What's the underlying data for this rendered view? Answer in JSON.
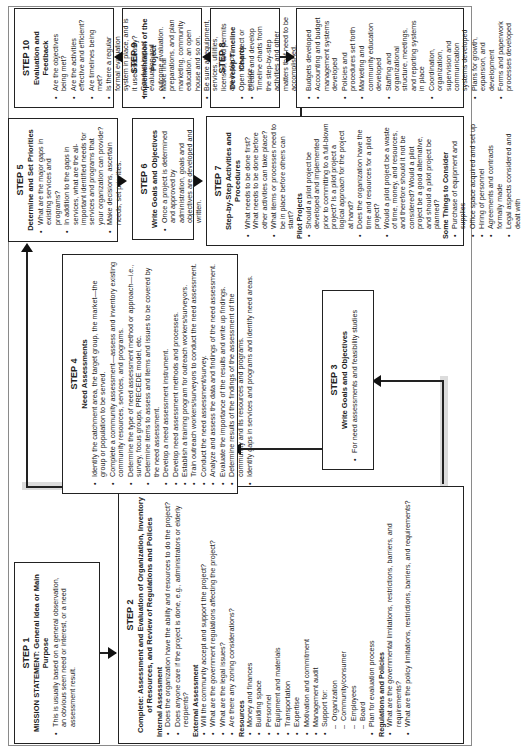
{
  "diagram": {
    "steps": [
      {
        "id": "step1",
        "number": "STEP 1",
        "title": "MISSION STATEMENT:  General Idea or Main Purpose",
        "bullets": [
          "This is usually based on a general observation, an obvious seen need or interest, or a need assessment result."
        ]
      },
      {
        "id": "step2",
        "number": "STEP 2",
        "title": "Complete: Assessment and Evaluation of Organization, Inventory of Resources, and Review of Regulations and Policies",
        "sections": [
          {
            "heading": "Internal Assessment",
            "bullets": [
              "Does the organization have the ability and resources to do the project?",
              "Does anyone care if the project is done, e.g., administrators or elderly recipients?"
            ]
          },
          {
            "heading": "External Assessment",
            "bullets": [
              "Will the community accept and support the project?",
              "What are the government regulations affecting the project?",
              "What are the legal issues?",
              "Are there any zoning considerations?"
            ]
          },
          {
            "heading": "Resources",
            "bullets": [
              "Money and finances",
              "Building space",
              "Personnel",
              "Equipment and materials",
              "Transportation",
              "Expertise",
              "Motivation and commitment",
              "Management audit",
              "Support for:"
            ],
            "sub_bullets": [
              "Organization",
              "Community/consumer",
              "Employees",
              "Board"
            ],
            "after_bullets": [
              "Plan for evaluation process"
            ]
          },
          {
            "heading": "Regulations and Policies",
            "bullets": [
              "What are the governmental limitations, restrictions, barriers, and requirements?",
              "What are the policy limitations, restrictions, barriers, and requirements?"
            ]
          }
        ]
      },
      {
        "id": "step3",
        "number": "STEP 3",
        "title": "Write Goals and Objectives",
        "bullets": [
          "For need assessments and feasibility studies"
        ]
      },
      {
        "id": "step4",
        "number": "STEP 4",
        "title": "Need Assessments",
        "bullets": [
          "Identify the catchment area, the target group, the market—the group or population to be served.",
          "Complete a community assessment—assess and inventory existing community resources, services, and programs.",
          "Determine the type of need assessment method or approach—i.e., survey, focus groups, PRECEDE model, etc.",
          "Determine items to assess and items and issues to be covered by the need assessment.",
          "Develop a need assessment instrument.",
          "Develop need assessment methods and processes.",
          "Establish a training program for outreach workers/surveyors.",
          "Train outreach workers/surveyors to conduct the need assessment.",
          "Conduct the need assessment/survey.",
          "Analyze and assess the data and findings of the need assessment.",
          "Evaluate the importance of the results and write up findings.",
          "Determine results of the findings of the assessment of the community and its resources and programs.",
          "Identify gaps in services and programs and identify need areas."
        ]
      },
      {
        "id": "step5",
        "number": "STEP 5",
        "title": "Determine and Set Priorities",
        "bullets": [
          "What are the major gaps in existing services and programs?",
          "In addition to the gaps in services, what are the all-important identified needs for services and programs that your organization can provide?",
          "Make decisions, ascertain needs, set priorities."
        ]
      },
      {
        "id": "step6",
        "number": "STEP 6",
        "title": "Write Goals and Objectives",
        "bullets": [
          "Once a project is determined and approved by administration, goals and objectives are developed and written."
        ]
      },
      {
        "id": "step7",
        "number": "STEP 7",
        "title": "Step-by-Step Activities and Procedures",
        "bullets": [
          "What needs to be done first? What needs to be done before other activities can take place?",
          "What items or processes need to be in place before others can start?"
        ],
        "sections": [
          {
            "heading": "Pilot Projects",
            "bullets": [
              "Should a pilot project be developed and implemented prior to committing to a full-blown project?  Is a pilot project a logical approach for the project at hand?",
              "Does the organization have the time and resources for a pilot project?",
              "Would a pilot project be a waste of time, money, and resources, and therefore should it not be considered?  Would a pilot project be a good alternative, and should a pilot project be planned?"
            ]
          },
          {
            "heading": "Some Things to Consider",
            "bullets": [
              "Purchase of equipment and supplies",
              "Office space acquired and set up",
              "Hiring of personnel",
              "Agreements and contracts formally made",
              "Legal aspects considered and dealt with"
            ]
          }
        ]
      },
      {
        "id": "step8",
        "number": "STEP 8",
        "title": "Develop Timeline Charts",
        "bullets": [
          "Create and develop Timeline charts from the step-by-step activities and other matters that need to be accomplished."
        ]
      },
      {
        "id": "step8_outcomes",
        "bullets": [
          "Budgets developed",
          "Accounting and budget management systems developed",
          "Policies and procedures set forth",
          "Marketing and community education developed",
          "Staffing and organizational structure, meetings, and reporting systems in place",
          "Coordination, organization, supervision and communication systems developed",
          "Plans for growth, expansion, and development",
          "Forms and paperwork processes developed"
        ]
      },
      {
        "id": "step9",
        "number": "STEP 9",
        "title": "Implementation of the Project",
        "bullets": [
          "Make final preparations, and plan marketing, community education, an open house and so on.",
          "Be sure all equipment, services, utilities, licenses, and permits are in place.",
          "Open the project or service."
        ]
      },
      {
        "id": "step10",
        "number": "STEP 10",
        "title": "Evaluation and Feedback",
        "bullets": [
          "Are the objectives being met?",
          "Are the activities effective and efficient?",
          "Are timelines being met?",
          "Is there a regular formal evaluation system in place, and is it used seriously?",
          "Conduct impact evaluation and outcome evaluation."
        ]
      }
    ]
  }
}
